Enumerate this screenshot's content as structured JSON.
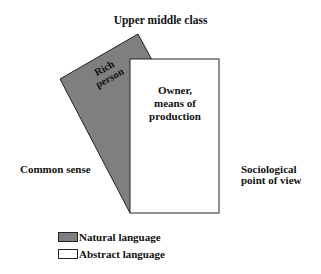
{
  "diagram": {
    "title": "Upper middle class",
    "left_label": "Common sense",
    "right_label_lines": [
      "Sociological",
      "point of view"
    ],
    "natural_card": {
      "text_lines": [
        "Rich",
        "person"
      ],
      "fill": "#7f7f7f"
    },
    "abstract_card": {
      "text_lines": [
        "Owner,",
        "means of",
        "production"
      ],
      "fill": "#ffffff"
    },
    "legend": [
      {
        "label": "Natural language",
        "color": "#7f7f7f"
      },
      {
        "label": "Abstract language",
        "color": "#ffffff"
      }
    ]
  }
}
